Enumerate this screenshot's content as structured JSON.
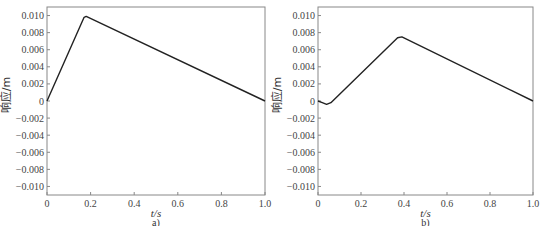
{
  "chart_data": [
    {
      "type": "line",
      "panel": "a)",
      "title": "",
      "xlabel": "t/s",
      "ylabel": "响应/m",
      "xlim": [
        0,
        1.0
      ],
      "ylim": [
        -0.011,
        0.011
      ],
      "x_ticks": [
        "0",
        "0.2",
        "0.4",
        "0.6",
        "0.8",
        "1.0"
      ],
      "y_ticks": [
        "0.010",
        "0.008",
        "0.006",
        "0.004",
        "0.002",
        "0",
        "-0.002",
        "-0.004",
        "-0.006",
        "-0.008",
        "-0.010"
      ],
      "grid": false,
      "series": [
        {
          "name": "response",
          "x": [
            0,
            0.17,
            0.18,
            1.0
          ],
          "y": [
            0,
            0.0098,
            0.0099,
            0
          ]
        }
      ]
    },
    {
      "type": "line",
      "panel": "b)",
      "title": "",
      "xlabel": "t/s",
      "ylabel": "响应/m",
      "xlim": [
        0,
        1.0
      ],
      "ylim": [
        -0.011,
        0.011
      ],
      "x_ticks": [
        "0",
        "0.2",
        "0.4",
        "0.6",
        "0.8",
        "1.0"
      ],
      "y_ticks": [
        "0.010",
        "0.008",
        "0.006",
        "0.004",
        "0.002",
        "0",
        "-0.002",
        "-0.004",
        "-0.006",
        "-0.008",
        "-0.010"
      ],
      "grid": false,
      "series": [
        {
          "name": "response",
          "x": [
            0,
            0.02,
            0.04,
            0.06,
            0.37,
            0.39,
            1.0
          ],
          "y": [
            0,
            -0.0002,
            -0.0004,
            -0.0002,
            0.0074,
            0.0075,
            0
          ]
        }
      ]
    }
  ],
  "labels": {
    "a": {
      "xlabel": "t/s",
      "ylabel": "响应/m",
      "caption": "a)"
    },
    "b": {
      "xlabel": "t/s",
      "ylabel": "响应/m",
      "caption": "b)"
    }
  }
}
